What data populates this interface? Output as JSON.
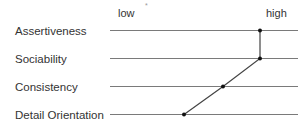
{
  "scale": {
    "low_label": "low",
    "high_label": "high",
    "marker": "*"
  },
  "traits": [
    {
      "label": "Assertiveness",
      "value": 0.8
    },
    {
      "label": "Sociability",
      "value": 0.8
    },
    {
      "label": "Consistency",
      "value": 0.6
    },
    {
      "label": "Detail Orientation",
      "value": 0.39
    }
  ],
  "colors": {
    "line": "#7a7a7a",
    "profile": "#444444",
    "dot": "#111111",
    "text": "#333333"
  }
}
